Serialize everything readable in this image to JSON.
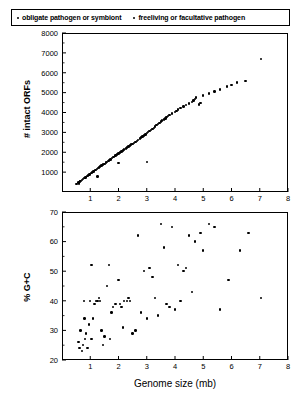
{
  "legend": {
    "entries": [
      {
        "marker": "dot-marker-icon",
        "label": "obligate pathogen or symbiont"
      },
      {
        "marker": "dot-marker-icon",
        "label": "freeliving or facultative pathogen"
      }
    ]
  },
  "axis_label_shared": "Genome size (mb)",
  "chart_data": [
    {
      "type": "scatter",
      "panel": "top",
      "title": "",
      "xlabel": "",
      "ylabel": "# intact ORFs",
      "xlim": [
        0,
        8
      ],
      "ylim": [
        0,
        8000
      ],
      "xticks": [
        1,
        2,
        3,
        4,
        5,
        6,
        7,
        8
      ],
      "yticks": [
        1000,
        2000,
        3000,
        4000,
        5000,
        6000,
        7000,
        8000
      ],
      "grid": false,
      "legend_position": "top",
      "points": [
        [
          0.58,
          480
        ],
        [
          0.64,
          520
        ],
        [
          0.66,
          560
        ],
        [
          0.7,
          600
        ],
        [
          0.75,
          650
        ],
        [
          0.8,
          700
        ],
        [
          0.83,
          730
        ],
        [
          0.86,
          760
        ],
        [
          0.9,
          800
        ],
        [
          0.94,
          840
        ],
        [
          0.97,
          880
        ],
        [
          1.0,
          920
        ],
        [
          1.05,
          960
        ],
        [
          1.08,
          1000
        ],
        [
          1.11,
          1040
        ],
        [
          1.14,
          1060
        ],
        [
          1.18,
          1100
        ],
        [
          1.23,
          1150
        ],
        [
          1.27,
          1200
        ],
        [
          1.3,
          1230
        ],
        [
          1.35,
          1280
        ],
        [
          1.4,
          1330
        ],
        [
          1.45,
          1380
        ],
        [
          1.5,
          1420
        ],
        [
          1.55,
          1480
        ],
        [
          1.6,
          1520
        ],
        [
          1.64,
          1560
        ],
        [
          1.66,
          1600
        ],
        [
          1.72,
          1640
        ],
        [
          1.78,
          1700
        ],
        [
          1.83,
          1750
        ],
        [
          1.88,
          1800
        ],
        [
          1.9,
          1840
        ],
        [
          1.95,
          1880
        ],
        [
          2.0,
          1930
        ],
        [
          2.05,
          1980
        ],
        [
          2.1,
          2030
        ],
        [
          2.15,
          2080
        ],
        [
          2.2,
          2130
        ],
        [
          2.26,
          2180
        ],
        [
          2.3,
          2230
        ],
        [
          2.36,
          2280
        ],
        [
          2.4,
          2330
        ],
        [
          2.45,
          2380
        ],
        [
          2.5,
          2420
        ],
        [
          2.55,
          2470
        ],
        [
          2.6,
          2520
        ],
        [
          2.66,
          2580
        ],
        [
          2.7,
          2630
        ],
        [
          2.76,
          2700
        ],
        [
          2.8,
          2740
        ],
        [
          2.85,
          2800
        ],
        [
          2.9,
          2850
        ],
        [
          2.95,
          2900
        ],
        [
          3.0,
          2960
        ],
        [
          3.05,
          3020
        ],
        [
          3.1,
          3080
        ],
        [
          3.15,
          3130
        ],
        [
          3.2,
          3180
        ],
        [
          3.25,
          3230
        ],
        [
          3.3,
          3300
        ],
        [
          3.35,
          3360
        ],
        [
          3.4,
          3420
        ],
        [
          3.45,
          3480
        ],
        [
          3.5,
          3540
        ],
        [
          3.55,
          3600
        ],
        [
          3.6,
          3650
        ],
        [
          3.66,
          3700
        ],
        [
          3.7,
          3760
        ],
        [
          3.76,
          3820
        ],
        [
          3.8,
          3880
        ],
        [
          3.9,
          3950
        ],
        [
          4.0,
          4020
        ],
        [
          4.05,
          4080
        ],
        [
          4.1,
          4150
        ],
        [
          4.2,
          4220
        ],
        [
          4.3,
          4300
        ],
        [
          4.4,
          4380
        ],
        [
          4.5,
          4450
        ],
        [
          4.6,
          4520
        ],
        [
          4.65,
          4600
        ],
        [
          4.7,
          4680
        ],
        [
          4.75,
          4750
        ],
        [
          4.85,
          4400
        ],
        [
          4.9,
          4480
        ],
        [
          5.0,
          4850
        ],
        [
          5.2,
          4950
        ],
        [
          5.4,
          5050
        ],
        [
          5.6,
          5150
        ],
        [
          5.85,
          5300
        ],
        [
          6.0,
          5380
        ],
        [
          6.2,
          5500
        ],
        [
          6.5,
          5600
        ],
        [
          7.05,
          6700
        ],
        [
          3.0,
          1500
        ],
        [
          2.0,
          1450
        ],
        [
          1.25,
          780
        ],
        [
          0.6,
          430
        ],
        [
          0.52,
          400
        ]
      ]
    },
    {
      "type": "scatter",
      "panel": "bottom",
      "title": "",
      "xlabel": "Genome size (mb)",
      "ylabel": "% G+C",
      "xlim": [
        0,
        8
      ],
      "ylim": [
        20,
        70
      ],
      "xticks": [
        1,
        2,
        3,
        4,
        5,
        6,
        7,
        8
      ],
      "yticks": [
        20,
        30,
        40,
        50,
        60,
        70
      ],
      "grid": false,
      "legend_position": "top",
      "points": [
        [
          0.58,
          26
        ],
        [
          0.62,
          24
        ],
        [
          0.66,
          30
        ],
        [
          0.7,
          23
        ],
        [
          0.74,
          25
        ],
        [
          0.78,
          40
        ],
        [
          0.82,
          27
        ],
        [
          0.86,
          29
        ],
        [
          0.9,
          24
        ],
        [
          0.95,
          32
        ],
        [
          1.0,
          40
        ],
        [
          1.05,
          52
        ],
        [
          1.1,
          34
        ],
        [
          1.15,
          39
        ],
        [
          1.2,
          40
        ],
        [
          1.25,
          40
        ],
        [
          1.3,
          41
        ],
        [
          1.35,
          40
        ],
        [
          1.4,
          30
        ],
        [
          1.5,
          28
        ],
        [
          1.6,
          45
        ],
        [
          1.66,
          52
        ],
        [
          1.75,
          36
        ],
        [
          1.8,
          38
        ],
        [
          1.9,
          39
        ],
        [
          2.0,
          47
        ],
        [
          2.05,
          39
        ],
        [
          2.1,
          38
        ],
        [
          2.2,
          40
        ],
        [
          2.3,
          40
        ],
        [
          2.35,
          41
        ],
        [
          2.4,
          40
        ],
        [
          2.5,
          29
        ],
        [
          2.6,
          30
        ],
        [
          2.7,
          62
        ],
        [
          2.8,
          36
        ],
        [
          2.9,
          50
        ],
        [
          3.0,
          34
        ],
        [
          3.1,
          51
        ],
        [
          3.2,
          48
        ],
        [
          3.3,
          41
        ],
        [
          3.4,
          35
        ],
        [
          3.5,
          66
        ],
        [
          3.6,
          58
        ],
        [
          3.7,
          39
        ],
        [
          3.8,
          38
        ],
        [
          3.9,
          65
        ],
        [
          4.0,
          37
        ],
        [
          4.1,
          52
        ],
        [
          4.2,
          40
        ],
        [
          4.3,
          50
        ],
        [
          4.4,
          51
        ],
        [
          4.5,
          62
        ],
        [
          4.6,
          43
        ],
        [
          4.7,
          60
        ],
        [
          4.9,
          63
        ],
        [
          5.0,
          57
        ],
        [
          5.2,
          66
        ],
        [
          5.4,
          65
        ],
        [
          5.6,
          37
        ],
        [
          5.9,
          47
        ],
        [
          6.3,
          57
        ],
        [
          6.6,
          63
        ],
        [
          7.05,
          41
        ],
        [
          1.45,
          25
        ],
        [
          1.7,
          27
        ],
        [
          2.15,
          31
        ],
        [
          0.8,
          34
        ],
        [
          1.05,
          27
        ]
      ]
    }
  ]
}
